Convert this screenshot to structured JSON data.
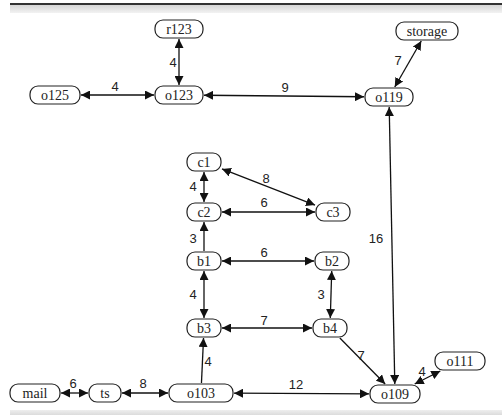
{
  "diagram": {
    "type": "weighted-graph",
    "nodes": [
      {
        "id": "r123",
        "label": "r123",
        "x": 179,
        "y": 29,
        "w": 48
      },
      {
        "id": "storage",
        "label": "storage",
        "x": 427,
        "y": 31,
        "w": 62
      },
      {
        "id": "o125",
        "label": "o125",
        "x": 55,
        "y": 95,
        "w": 50
      },
      {
        "id": "o123",
        "label": "o123",
        "x": 179,
        "y": 95,
        "w": 48
      },
      {
        "id": "o119",
        "label": "o119",
        "x": 389,
        "y": 97,
        "w": 48
      },
      {
        "id": "c1",
        "label": "c1",
        "x": 204,
        "y": 162,
        "w": 34
      },
      {
        "id": "c2",
        "label": "c2",
        "x": 204,
        "y": 212,
        "w": 34
      },
      {
        "id": "c3",
        "label": "c3",
        "x": 333,
        "y": 212,
        "w": 34
      },
      {
        "id": "b1",
        "label": "b1",
        "x": 204,
        "y": 261,
        "w": 34
      },
      {
        "id": "b2",
        "label": "b2",
        "x": 332,
        "y": 261,
        "w": 34
      },
      {
        "id": "b3",
        "label": "b3",
        "x": 204,
        "y": 328,
        "w": 34
      },
      {
        "id": "b4",
        "label": "b4",
        "x": 330,
        "y": 328,
        "w": 34
      },
      {
        "id": "mail",
        "label": "mail",
        "x": 35,
        "y": 393,
        "w": 50
      },
      {
        "id": "ts",
        "label": "ts",
        "x": 105,
        "y": 393,
        "w": 32
      },
      {
        "id": "o103",
        "label": "o103",
        "x": 201,
        "y": 393,
        "w": 64
      },
      {
        "id": "o109",
        "label": "o109",
        "x": 395,
        "y": 394,
        "w": 50
      },
      {
        "id": "o111",
        "label": "o111",
        "x": 460,
        "y": 361,
        "w": 50
      }
    ],
    "edges": [
      {
        "from": "r123",
        "to": "o123",
        "weight": "4",
        "bidirectional": true
      },
      {
        "from": "o125",
        "to": "o123",
        "weight": "4",
        "bidirectional": true
      },
      {
        "from": "o123",
        "to": "o119",
        "weight": "9",
        "bidirectional": true
      },
      {
        "from": "storage",
        "to": "o119",
        "weight": "7",
        "bidirectional": true
      },
      {
        "from": "o109",
        "to": "o119",
        "weight": "16",
        "bidirectional": true
      },
      {
        "from": "c1",
        "to": "c2",
        "weight": "4",
        "bidirectional": true
      },
      {
        "from": "c1",
        "to": "c3",
        "weight": "8",
        "bidirectional": true
      },
      {
        "from": "c2",
        "to": "c3",
        "weight": "6",
        "bidirectional": true
      },
      {
        "from": "b1",
        "to": "c2",
        "weight": "3",
        "bidirectional": false
      },
      {
        "from": "b1",
        "to": "b2",
        "weight": "6",
        "bidirectional": true
      },
      {
        "from": "b1",
        "to": "b3",
        "weight": "4",
        "bidirectional": true
      },
      {
        "from": "b2",
        "to": "b4",
        "weight": "3",
        "bidirectional": true
      },
      {
        "from": "b3",
        "to": "b4",
        "weight": "7",
        "bidirectional": true
      },
      {
        "from": "b4",
        "to": "o109",
        "weight": "7",
        "bidirectional": false
      },
      {
        "from": "o103",
        "to": "b3",
        "weight": "4",
        "bidirectional": false
      },
      {
        "from": "mail",
        "to": "ts",
        "weight": "6",
        "bidirectional": true
      },
      {
        "from": "ts",
        "to": "o103",
        "weight": "8",
        "bidirectional": true
      },
      {
        "from": "o103",
        "to": "o109",
        "weight": "12",
        "bidirectional": true
      },
      {
        "from": "o109",
        "to": "o111",
        "weight": "4",
        "bidirectional": true
      }
    ],
    "edge_labels": [
      {
        "text": "4",
        "x": 173,
        "y": 67
      },
      {
        "text": "4",
        "x": 115,
        "y": 91
      },
      {
        "text": "9",
        "x": 285,
        "y": 92
      },
      {
        "text": "7",
        "x": 398,
        "y": 65
      },
      {
        "text": "16",
        "x": 376,
        "y": 243
      },
      {
        "text": "4",
        "x": 193,
        "y": 191
      },
      {
        "text": "8",
        "x": 266,
        "y": 183
      },
      {
        "text": "6",
        "x": 264,
        "y": 207
      },
      {
        "text": "3",
        "x": 193,
        "y": 243
      },
      {
        "text": "6",
        "x": 264,
        "y": 257
      },
      {
        "text": "4",
        "x": 193,
        "y": 299
      },
      {
        "text": "3",
        "x": 321,
        "y": 299
      },
      {
        "text": "7",
        "x": 264,
        "y": 325
      },
      {
        "text": "7",
        "x": 361,
        "y": 360
      },
      {
        "text": "4",
        "x": 208,
        "y": 366
      },
      {
        "text": "6",
        "x": 73,
        "y": 388
      },
      {
        "text": "8",
        "x": 143,
        "y": 388
      },
      {
        "text": "12",
        "x": 296,
        "y": 389
      },
      {
        "text": "4",
        "x": 422,
        "y": 376
      }
    ]
  }
}
